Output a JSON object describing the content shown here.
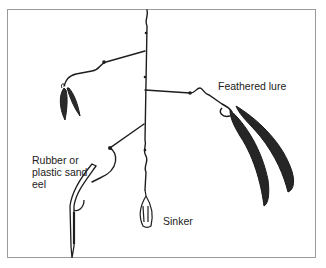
{
  "figure": {
    "labels": {
      "feathered_lure": "Feathered lure",
      "eel": "Rubber or plastic sand eel",
      "sinker": "Sinker"
    },
    "colors": {
      "ink": "#1e1e1e",
      "frame": "#9a9a9a",
      "background": "#ffffff"
    }
  }
}
